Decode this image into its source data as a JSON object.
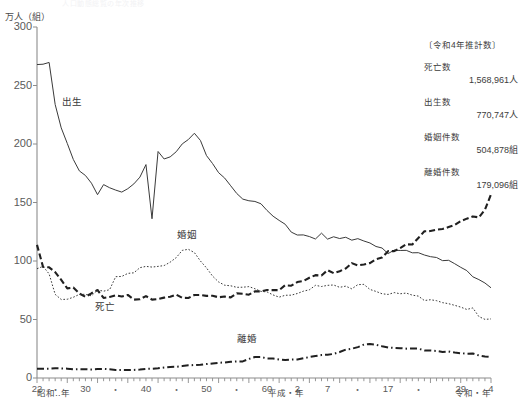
{
  "ghost_title": "人口動態総覧の年次推移",
  "axis": {
    "unit_label": "万人（組）",
    "y_ticks": [
      300,
      250,
      200,
      150,
      100,
      50,
      0
    ],
    "y_min": 0,
    "y_max": 300,
    "x_label_showa": "昭和‥年",
    "x_label_heisei": "平成・年",
    "x_label_reiwa": "令和・年"
  },
  "series_labels": {
    "births": "出生",
    "deaths": "死亡",
    "marriages": "婚姻",
    "divorces": "離婚"
  },
  "stats": {
    "heading": "〔令和4年推計数〕",
    "items": [
      {
        "name": "死亡数",
        "value": "1,568,961人"
      },
      {
        "name": "出生数",
        "value": "770,747人"
      },
      {
        "name": "婚姻件数",
        "value": "504,878組"
      },
      {
        "name": "離婚件数",
        "value": "179,096組"
      }
    ]
  },
  "chart_data": {
    "type": "line",
    "title": "人口動態総覧の年次推移",
    "xlabel": "年（昭和・平成・令和）",
    "ylabel": "万人（組）",
    "ylim": [
      0,
      300
    ],
    "xlim": [
      1947,
      2022
    ],
    "grid": false,
    "legend": "inline-labels",
    "x_tick_labels": [
      {
        "year": 1947,
        "label": "22",
        "era": "昭和"
      },
      {
        "year": 1950,
        "label": "・",
        "era": "昭和"
      },
      {
        "year": 1955,
        "label": "30",
        "era": "昭和"
      },
      {
        "year": 1960,
        "label": "・",
        "era": "昭和"
      },
      {
        "year": 1965,
        "label": "40",
        "era": "昭和"
      },
      {
        "year": 1970,
        "label": "・",
        "era": "昭和"
      },
      {
        "year": 1975,
        "label": "50",
        "era": "昭和"
      },
      {
        "year": 1980,
        "label": "・",
        "era": "昭和"
      },
      {
        "year": 1985,
        "label": "60",
        "era": "昭和"
      },
      {
        "year": 1990,
        "label": "2",
        "era": "平成"
      },
      {
        "year": 1995,
        "label": "7",
        "era": "平成"
      },
      {
        "year": 2000,
        "label": "・",
        "era": "平成"
      },
      {
        "year": 2005,
        "label": "17",
        "era": "平成"
      },
      {
        "year": 2010,
        "label": "・",
        "era": "平成"
      },
      {
        "year": 2017,
        "label": "29",
        "era": "平成"
      },
      {
        "year": 2022,
        "label": "4",
        "era": "令和"
      }
    ],
    "x": [
      1947,
      1948,
      1949,
      1950,
      1951,
      1952,
      1953,
      1954,
      1955,
      1956,
      1957,
      1958,
      1959,
      1960,
      1961,
      1962,
      1963,
      1964,
      1965,
      1966,
      1967,
      1968,
      1969,
      1970,
      1971,
      1972,
      1973,
      1974,
      1975,
      1976,
      1977,
      1978,
      1979,
      1980,
      1981,
      1982,
      1983,
      1984,
      1985,
      1986,
      1987,
      1988,
      1989,
      1990,
      1991,
      1992,
      1993,
      1994,
      1995,
      1996,
      1997,
      1998,
      1999,
      2000,
      2001,
      2002,
      2003,
      2004,
      2005,
      2006,
      2007,
      2008,
      2009,
      2010,
      2011,
      2012,
      2013,
      2014,
      2015,
      2016,
      2017,
      2018,
      2019,
      2020,
      2021,
      2022
    ],
    "series": [
      {
        "name": "出生",
        "style": "solid",
        "values": [
          267.9,
          268.2,
          269.7,
          233.8,
          213.8,
          200.5,
          186.8,
          177.0,
          173.1,
          166.5,
          156.7,
          165.3,
          162.6,
          160.6,
          158.9,
          161.8,
          165.9,
          171.7,
          182.4,
          136.1,
          193.6,
          187.2,
          189.0,
          193.4,
          200.1,
          203.8,
          209.2,
          203.0,
          190.1,
          183.3,
          175.5,
          170.9,
          164.3,
          157.7,
          152.9,
          151.5,
          150.9,
          148.9,
          143.2,
          138.3,
          134.7,
          131.4,
          124.7,
          122.2,
          122.3,
          120.9,
          118.8,
          123.8,
          118.7,
          120.7,
          119.2,
          120.3,
          117.8,
          119.1,
          117.1,
          115.4,
          112.4,
          111.1,
          106.3,
          109.3,
          109.0,
          109.1,
          107.0,
          107.1,
          105.1,
          103.7,
          103.0,
          100.3,
          100.6,
          97.7,
          94.6,
          91.8,
          86.5,
          84.1,
          81.2,
          77.1
        ]
      },
      {
        "name": "死亡",
        "style": "dashed-heavy",
        "values": [
          113.8,
          95.0,
          94.6,
          90.5,
          83.9,
          76.6,
          77.3,
          72.2,
          69.4,
          72.4,
          75.2,
          68.4,
          69.3,
          70.7,
          69.6,
          71.0,
          67.0,
          67.3,
          70.0,
          67.0,
          67.5,
          68.7,
          69.4,
          71.3,
          68.5,
          68.4,
          70.9,
          71.0,
          70.2,
          70.3,
          69.0,
          69.6,
          68.9,
          72.3,
          72.0,
          71.2,
          74.0,
          74.0,
          75.2,
          75.1,
          75.1,
          79.3,
          78.9,
          82.0,
          82.9,
          85.7,
          87.9,
          87.6,
          92.2,
          89.6,
          91.3,
          93.6,
          98.2,
          96.2,
          97.0,
          98.2,
          101.5,
          102.9,
          108.4,
          108.4,
          111.0,
          114.3,
          114.1,
          119.7,
          125.4,
          125.6,
          126.8,
          127.3,
          129.0,
          130.8,
          134.1,
          136.2,
          138.1,
          137.3,
          143.9,
          156.9
        ]
      },
      {
        "name": "婚姻",
        "style": "dotted",
        "values": [
          93.4,
          95.4,
          89.0,
          71.5,
          67.1,
          67.3,
          69.0,
          71.5,
          71.5,
          70.2,
          75.3,
          74.2,
          75.5,
          86.6,
          86.8,
          89.4,
          89.9,
          94.3,
          95.4,
          94.8,
          95.4,
          96.1,
          99.0,
          102.9,
          109.1,
          110.0,
          107.2,
          100.0,
          94.1,
          87.1,
          82.1,
          79.3,
          78.8,
          77.5,
          77.6,
          78.1,
          76.3,
          74.0,
          73.6,
          71.0,
          69.1,
          70.7,
          70.8,
          72.2,
          74.2,
          75.4,
          79.2,
          78.2,
          79.2,
          79.5,
          77.5,
          78.5,
          76.2,
          79.8,
          80.0,
          75.7,
          74.0,
          72.0,
          71.4,
          73.0,
          72.0,
          72.6,
          70.8,
          70.0,
          66.2,
          66.9,
          66.1,
          64.4,
          63.5,
          62.1,
          60.6,
          58.6,
          59.9,
          52.5,
          50.1,
          50.5
        ]
      },
      {
        "name": "離婚",
        "style": "dash-dot",
        "values": [
          7.9,
          7.9,
          7.9,
          8.3,
          8.2,
          8.0,
          7.5,
          7.6,
          7.5,
          7.3,
          7.6,
          7.8,
          7.4,
          6.9,
          6.9,
          6.8,
          6.9,
          7.2,
          7.8,
          7.9,
          8.3,
          9.0,
          9.5,
          9.6,
          10.2,
          10.8,
          11.1,
          11.4,
          11.9,
          12.4,
          13.0,
          13.3,
          13.9,
          14.2,
          14.2,
          16.3,
          17.9,
          17.9,
          16.7,
          16.6,
          15.8,
          15.4,
          15.7,
          15.8,
          16.9,
          17.9,
          18.8,
          19.6,
          19.9,
          20.6,
          22.2,
          24.3,
          25.0,
          26.4,
          28.5,
          29.0,
          28.4,
          27.1,
          26.1,
          25.7,
          25.5,
          25.1,
          25.3,
          25.1,
          23.6,
          23.5,
          23.1,
          22.2,
          22.6,
          21.7,
          21.2,
          20.8,
          20.9,
          19.3,
          18.4,
          17.9
        ]
      }
    ]
  }
}
